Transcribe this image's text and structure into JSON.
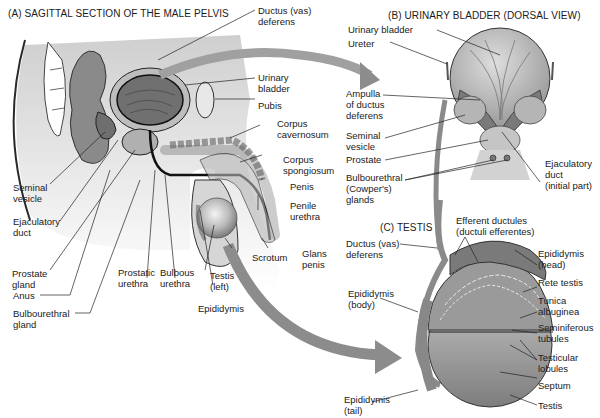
{
  "panels": {
    "a": {
      "title": "(A) SAGITTAL SECTION OF THE MALE PELVIS",
      "labels": {
        "ductus_deferens": "Ductus (vas)\ndeferens",
        "urinary_bladder": "Urinary\nbladder",
        "pubis": "Pubis",
        "corpus_cavernosum": "Corpus\ncavernosum",
        "corpus_spongiosum": "Corpus\nspongiosum",
        "penis": "Penis",
        "penile_urethra": "Penile\nurethra",
        "glans_penis": "Glans\npenis",
        "scrotum": "Scrotum",
        "testis_left": "Testis\n(left)",
        "epididymis": "Epididymis",
        "bulbous_urethra": "Bulbous\nurethra",
        "prostatic_urethra": "Prostatic\nurethra",
        "seminal_vesicle": "Seminal\nvesicle",
        "ejaculatory_duct": "Ejaculatory\nduct",
        "prostate_gland": "Prostate\ngland",
        "anus": "Anus",
        "bulbourethral_gland": "Bulbourethral\ngland"
      }
    },
    "b": {
      "title": "(B) URINARY BLADDER (DORSAL VIEW)",
      "labels": {
        "urinary_bladder": "Urinary bladder",
        "ureter": "Ureter",
        "ampulla": "Ampulla\nof ductus\ndeferens",
        "seminal_vesicle": "Seminal\nvesicle",
        "prostate": "Prostate",
        "bulbourethral_glands": "Bulbourethral\n(Cowper's)\nglands",
        "ejaculatory_duct": "Ejaculatory\nduct\n(initial part)"
      }
    },
    "c": {
      "title": "(C) TESTIS",
      "labels": {
        "ductus_deferens": "Ductus (vas)\ndeferens",
        "efferent_ductules": "Efferent ductules\n(ductuli efferentes)",
        "epididymis_head": "Epididymis\n(head)",
        "rete_testis": "Rete testis",
        "tunica_albuginea": "Tunica\nalbuginea",
        "seminiferous_tubules": "Seminiferous\ntubules",
        "testicular_lobules": "Testicular\nlobules",
        "septum": "Septum",
        "testis": "Testis",
        "epididymis_body": "Epididymis\n(body)",
        "epididymis_tail": "Epididymis\n(tail)"
      }
    }
  },
  "colors": {
    "tissue_light": "#d9d9d9",
    "tissue_mid": "#a8a8a8",
    "tissue_dark": "#6e6e6e",
    "outline": "#2a2a2a",
    "arrow": "#8c8c8c"
  }
}
